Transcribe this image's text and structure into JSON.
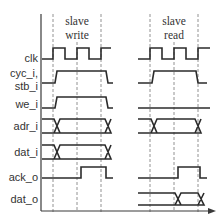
{
  "diagram": {
    "type": "timing-diagram",
    "phases": [
      {
        "id": "write",
        "line1": "slave",
        "line2": "write"
      },
      {
        "id": "read",
        "line1": "slave",
        "line2": "read"
      }
    ],
    "signals": [
      {
        "id": "clk",
        "label": "clk"
      },
      {
        "id": "cyc_stb",
        "label_line1": "cyc_i,",
        "label_line2": "stb_i"
      },
      {
        "id": "we_i",
        "label": "we_i"
      },
      {
        "id": "adr_i",
        "label": "adr_i"
      },
      {
        "id": "dat_i",
        "label": "dat_i"
      },
      {
        "id": "ack_o",
        "label": "ack_o"
      },
      {
        "id": "dat_o",
        "label": "dat_o"
      }
    ],
    "colors": {
      "signal": "#2b2b2b",
      "dashed_guide": "#777777",
      "text": "#333333"
    }
  }
}
